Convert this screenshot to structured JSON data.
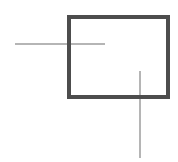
{
  "canvas": {
    "description": "line drawing of a thick-bordered rectangle crossed by two thin lines",
    "shapes": [
      {
        "name": "horizontal-line",
        "type": "line",
        "orientation": "horizontal",
        "note": "thin light gray line crossing the rectangle's left edge"
      },
      {
        "name": "vertical-line",
        "type": "line",
        "orientation": "vertical",
        "note": "thin light gray line crossing the rectangle's bottom edge"
      },
      {
        "name": "rectangle-outline",
        "type": "rectangle",
        "fill": "none",
        "note": "thick dark gray rectangular outline drawn above the thin lines"
      }
    ]
  },
  "colors": {
    "background": "#ffffff",
    "rect_border": "#4d4d4d",
    "line_color": "#b5b5b5"
  }
}
